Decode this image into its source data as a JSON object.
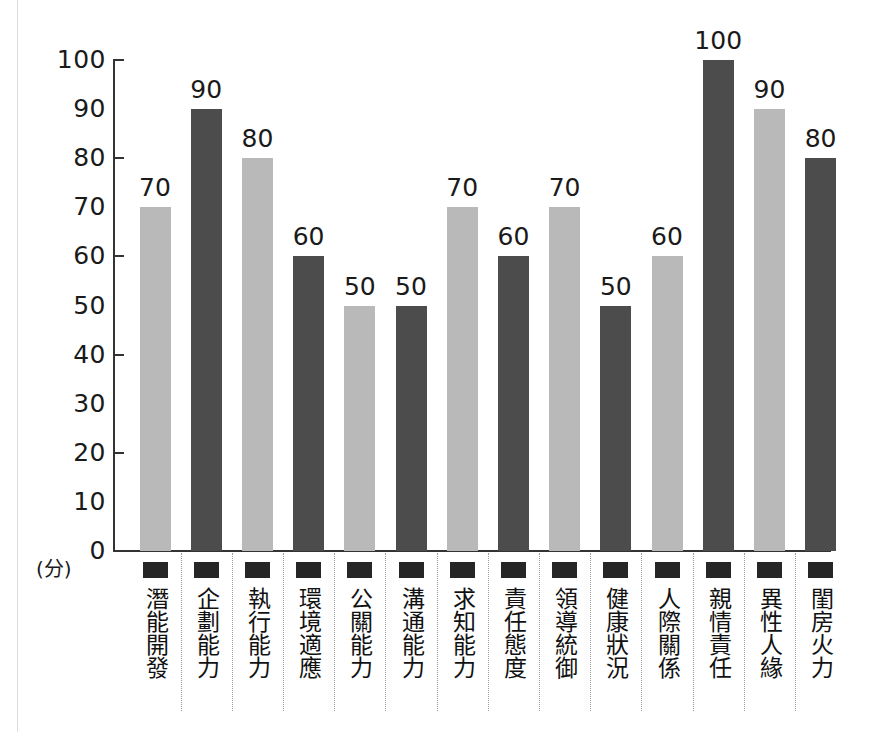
{
  "chart_data": {
    "type": "bar",
    "title": "",
    "xlabel": "",
    "ylabel": "(分)",
    "ylim": [
      0,
      100
    ],
    "ytick_labels": [
      "100",
      "90",
      "80",
      "70",
      "60",
      "50",
      "40",
      "30",
      "20",
      "10",
      "0"
    ],
    "ytick_values": [
      100,
      90,
      80,
      70,
      60,
      50,
      40,
      30,
      20,
      10,
      0
    ],
    "major_tick_values": [
      100,
      80,
      60,
      40,
      20,
      0
    ],
    "grid": false,
    "legend": "none",
    "categories": [
      "潛能開發",
      "企劃能力",
      "執行能力",
      "環境適應",
      "公關能力",
      "溝通能力",
      "求知能力",
      "責任態度",
      "領導統御",
      "健康狀況",
      "人際關係",
      "親情責任",
      "異性人緣",
      "閨房火力"
    ],
    "values": [
      70,
      90,
      80,
      60,
      50,
      50,
      70,
      60,
      70,
      50,
      60,
      100,
      90,
      80
    ],
    "bar_shades": [
      "light",
      "dark",
      "light",
      "dark",
      "light",
      "dark",
      "light",
      "dark",
      "light",
      "dark",
      "light",
      "dark",
      "light",
      "dark"
    ],
    "colors": {
      "light_bar": "#b9b9b9",
      "dark_bar": "#4c4c4c",
      "axis": "#333333",
      "text": "#1a1a1a",
      "marker": "#262626",
      "divider": "#9a9a9a",
      "background": "#ffffff"
    },
    "unit_label": "(分)",
    "marker_icon": "filled-square-marker"
  }
}
